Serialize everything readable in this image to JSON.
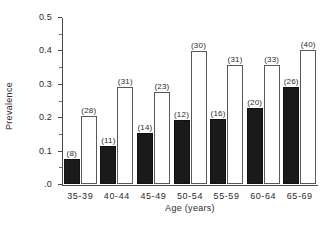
{
  "chart_data": {
    "type": "bar",
    "title": "",
    "xlabel": "Age  (years)",
    "ylabel": "Prevalence",
    "categories": [
      "35-39",
      "40-44",
      "45-49",
      "50-54",
      "55-59",
      "60-64",
      "65-69"
    ],
    "ylim": [
      0.0,
      0.5
    ],
    "ytick_labels": [
      ".0",
      "0.1",
      "0.2",
      "0.3",
      "0.4",
      "0.5"
    ],
    "ytick_values": [
      0.0,
      0.1,
      0.2,
      0.3,
      0.4,
      0.5
    ],
    "yminor_values": [
      0.05,
      0.15,
      0.25,
      0.35,
      0.45
    ],
    "grid": false,
    "legend": "none",
    "series": [
      {
        "name": "filled",
        "fill": "#1a1a1a",
        "values": [
          0.075,
          0.114,
          0.153,
          0.193,
          0.194,
          0.228,
          0.29
        ],
        "labels": [
          "(8)",
          "(11)",
          "(14)",
          "(12)",
          "(16)",
          "(20)",
          "(26)"
        ]
      },
      {
        "name": "open",
        "fill": "#ffffff",
        "values": [
          0.204,
          0.29,
          0.275,
          0.398,
          0.355,
          0.355,
          0.4
        ],
        "labels": [
          "(28)",
          "(31)",
          "(23)",
          "(30)",
          "(31)",
          "(33)",
          "(40)"
        ]
      }
    ]
  },
  "colors": {
    "axis": "#4a4a4a",
    "filled_bar": "#1a1a1a",
    "open_bar_border": "#585858",
    "text": "#2b2b2b",
    "background": "#ffffff"
  }
}
